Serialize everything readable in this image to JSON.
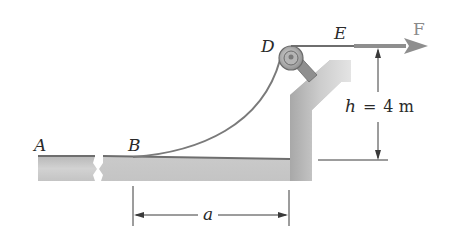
{
  "diagram": {
    "type": "mechanics-cable-pulley",
    "points": {
      "A": "A",
      "B": "B",
      "D": "D",
      "E": "E"
    },
    "force_label": "F",
    "height_label": {
      "var": "h",
      "eq": "=",
      "value": "4 m"
    },
    "horizontal_label": "a"
  },
  "colors": {
    "structure": "#c8c8c8",
    "structure_dark": "#8c8c8c",
    "cable": "#7a7a7a",
    "force_arrow": "#8e8e8e",
    "dimension_lines": "#3a3a3a",
    "text": "#2a2a2a"
  }
}
